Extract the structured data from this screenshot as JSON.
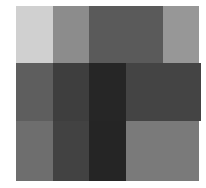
{
  "chart_data": {
    "type": "heatmap",
    "title": "",
    "xlabel": "",
    "ylabel": "",
    "grid": false,
    "legend": null,
    "rows": 3,
    "cols": 5,
    "colormap": "grayscale (0=black, 255=white)",
    "values": [
      [
        208,
        140,
        90,
        90,
        151
      ],
      [
        94,
        62,
        38,
        68,
        68
      ],
      [
        110,
        66,
        37,
        122,
        122
      ]
    ],
    "colors": [
      [
        "#d0d0d0",
        "#8c8c8c",
        "#5a5a5a",
        "#5a5a5a",
        "#979797"
      ],
      [
        "#5e5e5e",
        "#3e3e3e",
        "#262626",
        "#444444",
        "#444444"
      ],
      [
        "#6e6e6e",
        "#424242",
        "#252525",
        "#7a7a7a",
        "#7a7a7a"
      ]
    ]
  },
  "layout": {
    "col_widths": [
      37,
      36,
      37,
      37,
      37
    ],
    "row_heights": [
      57,
      58,
      60
    ],
    "row_widths": [
      183,
      185,
      183
    ]
  }
}
